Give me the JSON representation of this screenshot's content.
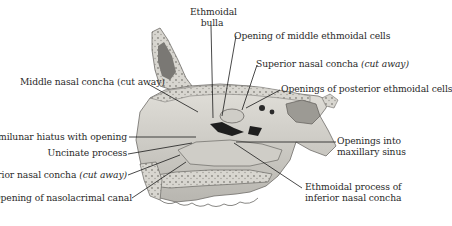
{
  "figure": {
    "colors": {
      "bone": "#d4d2cc",
      "bone_shadow": "#8c8a85",
      "cavity_dark": "#1e1e1e",
      "leader": "#1a1a1a",
      "text": "#2a2a2a"
    },
    "labels": {
      "ethmoidal_bulla_1": "Ethmoidal",
      "ethmoidal_bulla_2": "bulla",
      "opening_middle_ethmoidal": "Opening of middle ethmoidal cells",
      "superior_concha": "Superior nasal concha ",
      "superior_concha_paren": "(cut away)",
      "openings_posterior_ethmoidal": "Openings of posterior ethmoidal cells",
      "middle_concha": "Middle nasal concha (cut away)",
      "semilunar_hiatus": "Semilunar hiatus with opening",
      "uncinate_process": "Uncinate process",
      "inferior_concha": "Inferior nasal concha ",
      "inferior_concha_paren": "(cut away)",
      "nasolacrimal_canal": "Opening of nasolacrimal canal",
      "maxillary_openings_1": "Openings into",
      "maxillary_openings_2": "maxillary sinus",
      "ethmoidal_process_1": "Ethmoidal process of",
      "ethmoidal_process_2": "inferior nasal concha"
    }
  }
}
